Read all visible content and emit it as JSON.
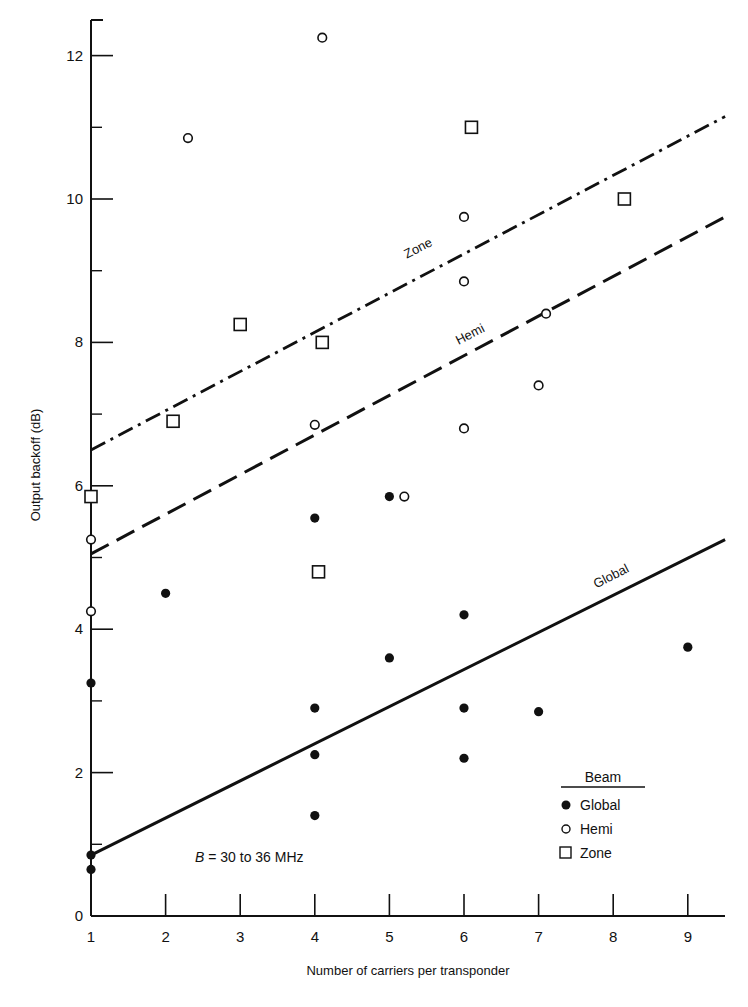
{
  "chart_data": {
    "type": "scatter",
    "title": "",
    "xlabel": "Number of carriers per transponder",
    "ylabel": "Output backoff (dB)",
    "xlim": [
      1,
      9.5
    ],
    "ylim": [
      0,
      12.5
    ],
    "x_ticks": [
      1,
      2,
      3,
      4,
      5,
      6,
      7,
      8,
      9
    ],
    "y_ticks": [
      0,
      2,
      4,
      6,
      8,
      10,
      12
    ],
    "y_minor_ticks": [
      1,
      3,
      5,
      7,
      9,
      11
    ],
    "grid": false,
    "legend": {
      "title": "Beam",
      "position": "lower right",
      "entries": [
        {
          "label": "Global",
          "marker": "filled-circle"
        },
        {
          "label": "Hemi",
          "marker": "open-circle"
        },
        {
          "label": "Zone",
          "marker": "open-square"
        }
      ]
    },
    "annotation": "B = 30 to 36 MHz",
    "series": [
      {
        "name": "Global",
        "marker": "filled-circle",
        "points": [
          [
            1,
            0.85
          ],
          [
            1,
            0.65
          ],
          [
            1,
            3.25
          ],
          [
            2,
            4.5
          ],
          [
            4,
            5.55
          ],
          [
            4,
            2.9
          ],
          [
            4,
            2.25
          ],
          [
            4,
            1.4
          ],
          [
            5,
            5.85
          ],
          [
            5,
            3.6
          ],
          [
            6,
            4.2
          ],
          [
            6,
            2.9
          ],
          [
            6,
            2.2
          ],
          [
            7,
            2.85
          ],
          [
            9,
            3.75
          ]
        ]
      },
      {
        "name": "Hemi",
        "marker": "open-circle",
        "points": [
          [
            1,
            5.25
          ],
          [
            1,
            4.25
          ],
          [
            2.3,
            10.85
          ],
          [
            4.1,
            12.25
          ],
          [
            4,
            6.85
          ],
          [
            5.2,
            5.85
          ],
          [
            6,
            9.75
          ],
          [
            6,
            8.85
          ],
          [
            6,
            6.8
          ],
          [
            7,
            7.4
          ],
          [
            7.1,
            8.4
          ]
        ]
      },
      {
        "name": "Zone",
        "marker": "open-square",
        "points": [
          [
            1,
            5.85
          ],
          [
            2.1,
            6.9
          ],
          [
            3,
            8.25
          ],
          [
            4.1,
            8.0
          ],
          [
            4.05,
            4.8
          ],
          [
            6.1,
            11.0
          ],
          [
            8.15,
            10.0
          ]
        ]
      }
    ],
    "fit_lines": [
      {
        "name": "Zone",
        "style": "dash-dot",
        "from": [
          1,
          6.5
        ],
        "to": [
          9.5,
          11.15
        ]
      },
      {
        "name": "Hemi",
        "style": "dashed",
        "from": [
          1,
          5.05
        ],
        "to": [
          9.5,
          9.75
        ]
      },
      {
        "name": "Global",
        "style": "solid",
        "from": [
          1,
          0.85
        ],
        "to": [
          9.5,
          5.25
        ]
      }
    ]
  },
  "labels": {
    "ylabel": "Output backoff (dB)",
    "xlabel": "Number of carriers per transponder",
    "annotation_var": "B",
    "annotation_rest": " = 30 to 36 MHz",
    "line_zone": "Zone",
    "line_hemi": "Hemi",
    "line_global": "Global",
    "legend_title": "Beam",
    "legend_global": "Global",
    "legend_hemi": "Hemi",
    "legend_zone": "Zone"
  }
}
